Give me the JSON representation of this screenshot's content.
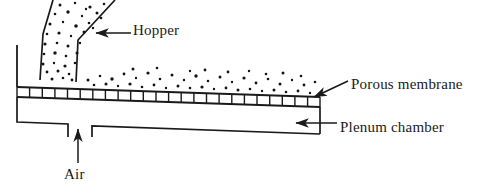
{
  "figure": {
    "type": "technical-schematic",
    "width": 487,
    "height": 188,
    "background_color": "#ffffff",
    "line_color": "#1a1a1a"
  },
  "labels": {
    "hopper": "Hopper",
    "porous_membrane": "Porous membrane",
    "plenum_chamber": "Plenum chamber",
    "air": "Air"
  },
  "components": {
    "hopper": {
      "name": "Hopper",
      "description": "funnel holding granular particles feeding onto the bed"
    },
    "porous_membrane": {
      "name": "Porous membrane",
      "description": "perforated distributor plate drawn as a ladder of segments",
      "segments": 24
    },
    "plenum_chamber": {
      "name": "Plenum chamber",
      "description": "air box beneath the distributor plate"
    },
    "air_inlet": {
      "name": "Air",
      "description": "upward arrow marking pressurised air entering the plenum"
    },
    "particle_bed": {
      "name": "particle bed",
      "description": "scattered granular particles resting on the membrane"
    }
  },
  "arrows": [
    {
      "name": "hopper-leader",
      "points_to": "hopper wall",
      "direction": "left"
    },
    {
      "name": "porous-membrane-leader",
      "points_to": "right end of membrane",
      "direction": "down-left"
    },
    {
      "name": "plenum-chamber-leader",
      "points_to": "inside plenum chamber",
      "direction": "left"
    },
    {
      "name": "air-inlet-arrow",
      "points_to": "plenum inlet gap",
      "direction": "up"
    }
  ]
}
